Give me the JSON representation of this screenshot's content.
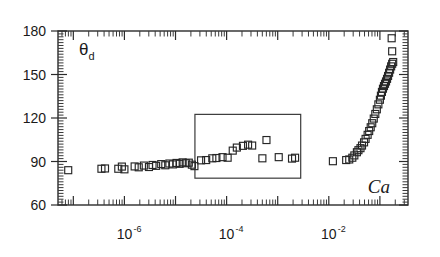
{
  "chart_data": {
    "type": "scatter",
    "title": "",
    "xlabel": "Ca",
    "ylabel": "θ",
    "ylabel_sub": "d",
    "xscale": "log",
    "yscale": "linear",
    "xlim": [
      -7.3,
      -0.45
    ],
    "ylim": [
      60,
      180
    ],
    "yticks": [
      60,
      90,
      120,
      150,
      180
    ],
    "ytick_labels": [
      "60",
      "90",
      "120",
      "150",
      "180"
    ],
    "xtick_decades": [
      -7,
      -6,
      -5,
      -4,
      -3,
      -2,
      -1
    ],
    "xtick_labels": [
      {
        "exp": "-6",
        "base": "10",
        "log_x": -6
      },
      {
        "exp": "-4",
        "base": "10",
        "log_x": -4
      },
      {
        "exp": "-2",
        "base": "10",
        "log_x": -2
      }
    ],
    "grid": false,
    "legend": null,
    "marker_style": "open-square",
    "marker_size_px": 7,
    "inset_box": {
      "x0_log": -4.62,
      "x1_log": -2.55,
      "y0": 78.5,
      "y1": 122.5
    },
    "series": [
      {
        "name": "dynamic-contact-angle",
        "points": [
          [
            -7.1,
            84.0
          ],
          [
            -6.45,
            85.0
          ],
          [
            -6.38,
            85.2
          ],
          [
            -6.12,
            85.0
          ],
          [
            -6.05,
            86.5
          ],
          [
            -6.0,
            84.6
          ],
          [
            -5.8,
            86.6
          ],
          [
            -5.72,
            86.0
          ],
          [
            -5.62,
            87.2
          ],
          [
            -5.52,
            86.2
          ],
          [
            -5.45,
            87.6
          ],
          [
            -5.38,
            87.0
          ],
          [
            -5.28,
            88.2
          ],
          [
            -5.2,
            87.4
          ],
          [
            -5.12,
            88.6
          ],
          [
            -5.05,
            88.0
          ],
          [
            -4.98,
            89.0
          ],
          [
            -4.92,
            88.4
          ],
          [
            -4.86,
            89.4
          ],
          [
            -4.8,
            88.8
          ],
          [
            -4.74,
            89.2
          ],
          [
            -4.68,
            87.8
          ],
          [
            -4.63,
            86.8
          ],
          [
            -4.5,
            90.8
          ],
          [
            -4.4,
            91.0
          ],
          [
            -4.28,
            92.2
          ],
          [
            -4.2,
            92.4
          ],
          [
            -4.08,
            93.0
          ],
          [
            -3.98,
            92.6
          ],
          [
            -3.88,
            97.5
          ],
          [
            -3.8,
            99.6
          ],
          [
            -3.68,
            100.8
          ],
          [
            -3.58,
            101.6
          ],
          [
            -3.5,
            101.0
          ],
          [
            -3.22,
            104.8
          ],
          [
            -3.3,
            92.2
          ],
          [
            -2.98,
            93.0
          ],
          [
            -2.72,
            92.0
          ],
          [
            -2.66,
            92.6
          ],
          [
            -1.92,
            90.2
          ],
          [
            -1.66,
            91.0
          ],
          [
            -1.6,
            91.4
          ],
          [
            -1.54,
            92.6
          ],
          [
            -1.5,
            94.2
          ],
          [
            -1.45,
            96.4
          ],
          [
            -1.42,
            97.8
          ],
          [
            -1.38,
            99.2
          ],
          [
            -1.35,
            101.0
          ],
          [
            -1.31,
            103.2
          ],
          [
            -1.28,
            105.6
          ],
          [
            -1.24,
            108.4
          ],
          [
            -1.21,
            111.0
          ],
          [
            -1.18,
            113.6
          ],
          [
            -1.15,
            116.4
          ],
          [
            -1.12,
            119.6
          ],
          [
            -1.09,
            122.8
          ],
          [
            -1.06,
            126.0
          ],
          [
            -1.03,
            129.4
          ],
          [
            -1.0,
            132.6
          ],
          [
            -0.98,
            135.4
          ],
          [
            -0.96,
            138.0
          ],
          [
            -0.94,
            140.2
          ],
          [
            -0.92,
            142.0
          ],
          [
            -0.9,
            143.6
          ],
          [
            -0.88,
            145.2
          ],
          [
            -0.86,
            147.0
          ],
          [
            -0.84,
            149.0
          ],
          [
            -0.82,
            151.2
          ],
          [
            -0.8,
            153.4
          ],
          [
            -0.78,
            155.6
          ],
          [
            -0.76,
            157.4
          ],
          [
            -0.74,
            158.6
          ],
          [
            -0.76,
            166.0
          ],
          [
            -0.77,
            175.0
          ]
        ]
      }
    ]
  },
  "annotations": {
    "y_axis_label_text": "θ",
    "y_axis_label_subscript": "d",
    "x_axis_label_text": "Ca"
  }
}
